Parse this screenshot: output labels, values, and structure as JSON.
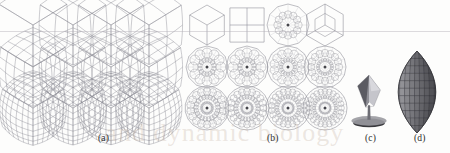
{
  "figure": {
    "background_color": "#fdfdfc",
    "wire_color": "#8a8a93",
    "wire_color_light": "#b9b9c1",
    "shade_dark": "#3f3f44",
    "shade_mid": "#6e6e75",
    "shade_light": "#c9c9cf",
    "caption_color": "#2b2b2b",
    "watermark_text": "and dynamic biology",
    "panels": [
      {
        "id": "a",
        "label": "(a)",
        "label_x": 98,
        "label_y": 133,
        "description": "rhombic-hexahedron subdivision surfaces",
        "columns": 4,
        "rows": 3,
        "shape_type": "cube-wireframe",
        "row_subdivisions": [
          1,
          3,
          6
        ],
        "column_refinements": [
          1,
          2,
          3,
          4
        ],
        "cells": [
          {
            "row": 0,
            "col": 0,
            "cx": 33,
            "cy": 25,
            "r": 21,
            "n": 1,
            "twist": 0.0
          },
          {
            "row": 0,
            "col": 1,
            "cx": 73,
            "cy": 25,
            "r": 21,
            "n": 2,
            "twist": 0.05
          },
          {
            "row": 0,
            "col": 2,
            "cx": 111,
            "cy": 25,
            "r": 21,
            "n": 2,
            "twist": 0.12
          },
          {
            "row": 0,
            "col": 3,
            "cx": 149,
            "cy": 25,
            "r": 21,
            "n": 2,
            "twist": 0.18
          },
          {
            "row": 1,
            "col": 0,
            "cx": 33,
            "cy": 67,
            "r": 22,
            "n": 4,
            "twist": 0.1
          },
          {
            "row": 1,
            "col": 1,
            "cx": 73,
            "cy": 67,
            "r": 22,
            "n": 4,
            "twist": 0.16
          },
          {
            "row": 1,
            "col": 2,
            "cx": 111,
            "cy": 67,
            "r": 22,
            "n": 4,
            "twist": 0.22
          },
          {
            "row": 1,
            "col": 3,
            "cx": 149,
            "cy": 67,
            "r": 22,
            "n": 4,
            "twist": 0.26
          },
          {
            "row": 2,
            "col": 0,
            "cx": 33,
            "cy": 108,
            "r": 23,
            "n": 7,
            "twist": 0.14
          },
          {
            "row": 2,
            "col": 1,
            "cx": 73,
            "cy": 108,
            "r": 23,
            "n": 7,
            "twist": 0.2
          },
          {
            "row": 2,
            "col": 2,
            "cx": 111,
            "cy": 108,
            "r": 23,
            "n": 7,
            "twist": 0.26
          },
          {
            "row": 2,
            "col": 3,
            "cx": 149,
            "cy": 108,
            "r": 23,
            "n": 7,
            "twist": 0.3
          }
        ]
      },
      {
        "id": "b",
        "label": "(b)",
        "label_x": 267,
        "label_y": 133,
        "description": "planar rosette subdivision: square, dodecagon, hexagon",
        "columns": 4,
        "rows": 3,
        "shape_type": "rosette-wireframe",
        "row_subdivisions": [
          1,
          3,
          6
        ],
        "cells": [
          {
            "row": 0,
            "col": 0,
            "cx": 207,
            "cy": 25,
            "r": 20,
            "sides": 6,
            "rings": 1
          },
          {
            "row": 0,
            "col": 1,
            "cx": 247,
            "cy": 25,
            "r": 18,
            "sides": 4,
            "rings": 1
          },
          {
            "row": 0,
            "col": 2,
            "cx": 288,
            "cy": 25,
            "r": 21,
            "sides": 12,
            "rings": 1
          },
          {
            "row": 0,
            "col": 3,
            "cx": 325,
            "cy": 25,
            "r": 21,
            "sides": 6,
            "rings": 1
          },
          {
            "row": 1,
            "col": 0,
            "cx": 207,
            "cy": 67,
            "r": 21,
            "sides": 12,
            "rings": 2
          },
          {
            "row": 1,
            "col": 1,
            "cx": 247,
            "cy": 67,
            "r": 21,
            "sides": 12,
            "rings": 2
          },
          {
            "row": 1,
            "col": 2,
            "cx": 288,
            "cy": 67,
            "r": 21,
            "sides": 14,
            "rings": 2
          },
          {
            "row": 1,
            "col": 3,
            "cx": 325,
            "cy": 67,
            "r": 21,
            "sides": 16,
            "rings": 2
          },
          {
            "row": 2,
            "col": 0,
            "cx": 207,
            "cy": 108,
            "r": 22,
            "sides": 18,
            "rings": 3
          },
          {
            "row": 2,
            "col": 1,
            "cx": 247,
            "cy": 108,
            "r": 22,
            "sides": 20,
            "rings": 3
          },
          {
            "row": 2,
            "col": 2,
            "cx": 288,
            "cy": 108,
            "r": 22,
            "sides": 22,
            "rings": 3
          },
          {
            "row": 2,
            "col": 3,
            "cx": 325,
            "cy": 108,
            "r": 22,
            "sides": 24,
            "rings": 3
          }
        ]
      },
      {
        "id": "c",
        "label": "(c)",
        "label_x": 365,
        "label_y": 133,
        "description": "shaded faceted rhombic solid on dark base",
        "cx": 369,
        "cy": 100,
        "width": 22,
        "height": 52
      },
      {
        "id": "d",
        "label": "(d)",
        "label_x": 414,
        "label_y": 133,
        "description": "shaded faceted lens / almond solid",
        "cx": 417,
        "cy": 92,
        "width": 40,
        "height": 82
      }
    ]
  }
}
